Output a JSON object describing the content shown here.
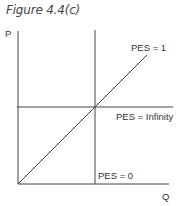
{
  "figure": {
    "title": "Figure 4.4(c)"
  },
  "axes": {
    "y_label": "P",
    "x_label": "Q"
  },
  "lines": {
    "diagonal": "PES = 1",
    "horizontal": "PES = Infinity",
    "vertical": "PES = 0"
  },
  "colors": {
    "line": "#333333",
    "text": "#333333"
  }
}
